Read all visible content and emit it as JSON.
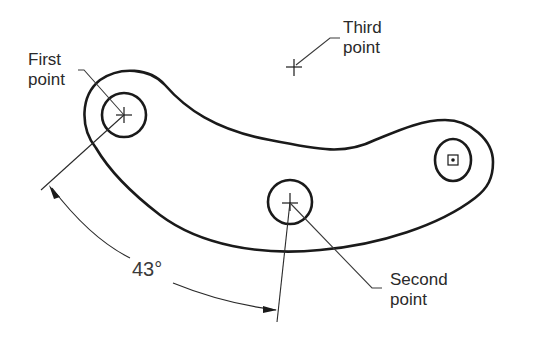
{
  "diagram": {
    "type": "cad-arc-three-point",
    "colors": {
      "background": "#ffffff",
      "outline": "#1a1a1a",
      "leader": "#3a3a3a",
      "text": "#2a2a2a"
    },
    "labels": {
      "first_point": [
        "First",
        "point"
      ],
      "third_point": [
        "Third",
        "point"
      ],
      "second_point": [
        "Second",
        "point"
      ]
    },
    "dimension": {
      "angle_text": "43°"
    },
    "points": {
      "first": {
        "x": 124,
        "y": 115
      },
      "second": {
        "x": 290,
        "y": 202
      },
      "third": {
        "x": 294,
        "y": 67
      },
      "end_hole": {
        "x": 453,
        "y": 160
      }
    }
  }
}
